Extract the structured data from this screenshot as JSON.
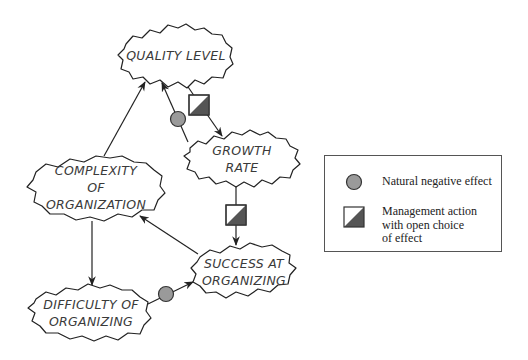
{
  "diagram": {
    "nodes": [
      {
        "id": "quality",
        "label": "QUALITY LEVEL"
      },
      {
        "id": "growth",
        "label": "GROWTH\nRATE"
      },
      {
        "id": "complexity",
        "label": "COMPLEXITY\nOF\nORGANIZATION"
      },
      {
        "id": "difficulty",
        "label": "DIFFICULTY OF\nORGANIZING"
      },
      {
        "id": "success",
        "label": "SUCCESS AT\nORGANIZING"
      }
    ],
    "edges": [
      {
        "from": "quality",
        "to": "growth",
        "marker": "management-action"
      },
      {
        "from": "growth",
        "to": "quality",
        "marker": "natural-negative"
      },
      {
        "from": "growth",
        "to": "success",
        "marker": "management-action"
      },
      {
        "from": "complexity",
        "to": "quality",
        "marker": "none"
      },
      {
        "from": "success",
        "to": "complexity",
        "marker": "none"
      },
      {
        "from": "complexity",
        "to": "difficulty",
        "marker": "none"
      },
      {
        "from": "difficulty",
        "to": "success",
        "marker": "natural-negative"
      }
    ]
  },
  "legend": {
    "items": [
      {
        "icon": "gray-circle-icon",
        "label": "Natural negative effect"
      },
      {
        "icon": "half-filled-square-icon",
        "label": "Management action\nwith open choice\nof effect"
      }
    ]
  },
  "colors": {
    "stroke": "#222222",
    "circle_fill": "#9a9a9a",
    "square_fill": "#555555",
    "text": "#3a3a3a"
  }
}
